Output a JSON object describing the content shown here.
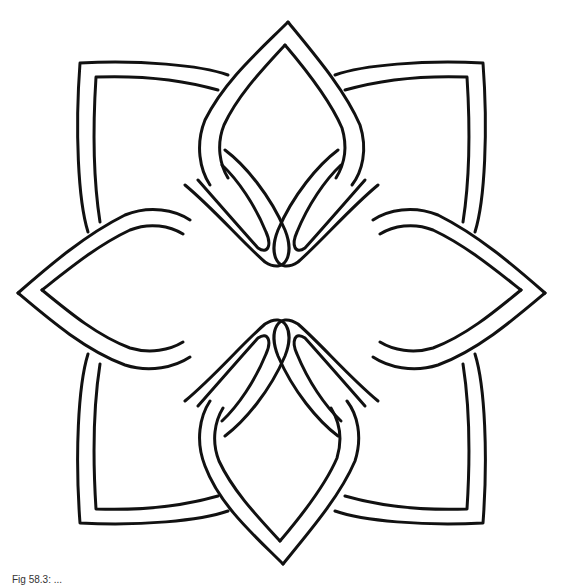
{
  "figure": {
    "stroke_color": "#111111",
    "background_color": "#ffffff",
    "caption": "Fig 58.3: ..."
  }
}
